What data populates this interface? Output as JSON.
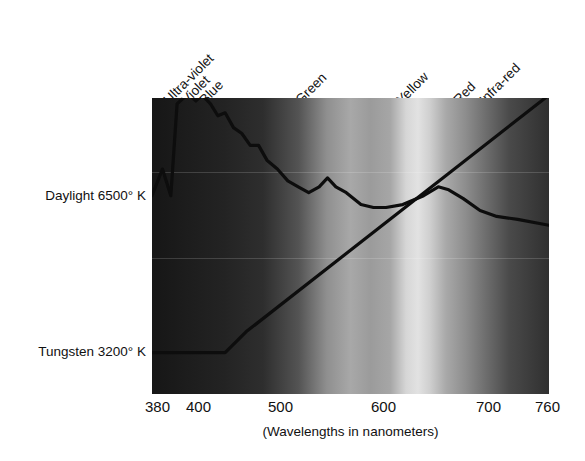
{
  "chart_data": {
    "type": "line",
    "title": "",
    "subtitle": "",
    "xlabel": "(Wavelengths in nanometers)",
    "ylabel": "",
    "xlim": [
      380,
      760
    ],
    "ylim": [
      0,
      100
    ],
    "grid": false,
    "legend_position": "left-axis-labels",
    "x_ticks": [
      {
        "label": "380",
        "value": 380
      },
      {
        "label": "400",
        "value": 400
      },
      {
        "label": "500",
        "value": 500
      },
      {
        "label": "600",
        "value": 600
      },
      {
        "label": "700",
        "value": 700
      },
      {
        "label": "760",
        "value": 760
      }
    ],
    "y_axis_labels": [
      {
        "label": "Daylight 6500° K",
        "value": 66
      },
      {
        "label": "Tungsten 3200° K",
        "value": 14
      }
    ],
    "band_labels": [
      {
        "label": "Ultra-violet",
        "x_px": 171,
        "y_px": 92
      },
      {
        "label": "Violet",
        "x_px": 186,
        "y_px": 92
      },
      {
        "label": "Blue",
        "x_px": 203,
        "y_px": 92
      },
      {
        "label": "Green",
        "x_px": 301,
        "y_px": 92
      },
      {
        "label": "Yellow",
        "x_px": 402,
        "y_px": 92
      },
      {
        "label": "Red",
        "x_px": 459,
        "y_px": 92
      },
      {
        "label": "Infra-red",
        "x_px": 486,
        "y_px": 92
      }
    ],
    "series": [
      {
        "name": "Daylight 6500° K",
        "color": "#0d0d0d",
        "points": [
          [
            380,
            67
          ],
          [
            390,
            76
          ],
          [
            398,
            67
          ],
          [
            404,
            98
          ],
          [
            410,
            100
          ],
          [
            416,
            101
          ],
          [
            422,
            99
          ],
          [
            428,
            101
          ],
          [
            436,
            98
          ],
          [
            443,
            94
          ],
          [
            450,
            95
          ],
          [
            458,
            90
          ],
          [
            466,
            88
          ],
          [
            474,
            84
          ],
          [
            482,
            84
          ],
          [
            490,
            79
          ],
          [
            500,
            76
          ],
          [
            510,
            72
          ],
          [
            520,
            70
          ],
          [
            530,
            68
          ],
          [
            540,
            70
          ],
          [
            548,
            73
          ],
          [
            556,
            70
          ],
          [
            566,
            68
          ],
          [
            580,
            64
          ],
          [
            592,
            63
          ],
          [
            604,
            63
          ],
          [
            620,
            64
          ],
          [
            640,
            67
          ],
          [
            654,
            70
          ],
          [
            664,
            69
          ],
          [
            678,
            66
          ],
          [
            694,
            62
          ],
          [
            710,
            60
          ],
          [
            730,
            59
          ],
          [
            760,
            57
          ]
        ]
      },
      {
        "name": "Tungsten 3200° K",
        "color": "#0d0d0d",
        "points": [
          [
            380,
            14
          ],
          [
            450,
            14
          ],
          [
            470,
            21
          ],
          [
            760,
            101
          ]
        ]
      }
    ],
    "spectrum_stops": [
      {
        "pos": 0.0,
        "color": "#161616"
      },
      {
        "pos": 0.08,
        "color": "#1c1c1c"
      },
      {
        "pos": 0.18,
        "color": "#232323"
      },
      {
        "pos": 0.28,
        "color": "#2e2e2e"
      },
      {
        "pos": 0.37,
        "color": "#545454"
      },
      {
        "pos": 0.44,
        "color": "#8f8f8f"
      },
      {
        "pos": 0.5,
        "color": "#a8a8a8"
      },
      {
        "pos": 0.55,
        "color": "#9b9b9b"
      },
      {
        "pos": 0.6,
        "color": "#a6a6a6"
      },
      {
        "pos": 0.64,
        "color": "#d6d6d6"
      },
      {
        "pos": 0.67,
        "color": "#e2e2e2"
      },
      {
        "pos": 0.7,
        "color": "#cfcfcf"
      },
      {
        "pos": 0.74,
        "color": "#a9a9a9"
      },
      {
        "pos": 0.79,
        "color": "#8d8d8d"
      },
      {
        "pos": 0.84,
        "color": "#6e6e6e"
      },
      {
        "pos": 0.9,
        "color": "#4a4a4a"
      },
      {
        "pos": 0.96,
        "color": "#3a3a3a"
      },
      {
        "pos": 1.0,
        "color": "#303030"
      }
    ]
  },
  "axis": {
    "caption": "(Wavelengths in nanometers)",
    "ticks": [
      "380",
      "400",
      "500",
      "600",
      "700",
      "760"
    ]
  },
  "y_labels": {
    "daylight": "Daylight 6500° K",
    "tungsten": "Tungsten 3200° K"
  },
  "bands": {
    "ultra_violet": "Ultra-violet",
    "violet": "Violet",
    "blue": "Blue",
    "green": "Green",
    "yellow": "Yellow",
    "red": "Red",
    "infra_red": "Infra-red"
  },
  "colors": {
    "curve": "#0d0d0d",
    "text": "#111111",
    "background": "#ffffff"
  }
}
